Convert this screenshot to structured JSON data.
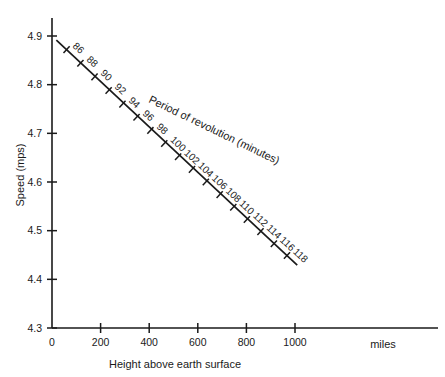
{
  "chart_data": {
    "type": "line",
    "title": "",
    "xlabel": "Height above earth surface",
    "ylabel": "Speed (mps)",
    "x_unit": "miles",
    "xlim": [
      0,
      1200
    ],
    "ylim": [
      4.3,
      4.9
    ],
    "xticks": [
      "0",
      "200",
      "400",
      "600",
      "800",
      "1000"
    ],
    "xtick_values": [
      0,
      200,
      400,
      600,
      800,
      1000
    ],
    "yticks": [
      "4.9",
      "4.8",
      "4.7",
      "4.6",
      "4.5",
      "4.4",
      "4.3"
    ],
    "ytick_values": [
      4.9,
      4.8,
      4.7,
      4.6,
      4.5,
      4.4,
      4.3
    ],
    "grid": false,
    "legend": "none",
    "annotation": "Period of revolution (minutes)",
    "point_label_series": "period_minutes",
    "series": [
      {
        "name": "Orbital speed vs height",
        "x": [
          60,
          117,
          175,
          233,
          290,
          348,
          405,
          462,
          519,
          576,
          633,
          690,
          746,
          802,
          858,
          913,
          967
        ],
        "y": [
          4.872,
          4.844,
          4.816,
          4.788,
          4.76,
          4.733,
          4.706,
          4.679,
          4.652,
          4.626,
          4.6,
          4.574,
          4.548,
          4.523,
          4.498,
          4.473,
          4.449
        ],
        "point_labels": [
          "86",
          "88",
          "90",
          "92",
          "94",
          "96",
          "98",
          "100",
          "102",
          "104",
          "106",
          "108",
          "110",
          "112",
          "114",
          "116",
          "118"
        ]
      }
    ]
  },
  "axis": {
    "y_title": "Speed (mps)",
    "x_title": "Height above earth surface",
    "x_unit": "miles"
  }
}
